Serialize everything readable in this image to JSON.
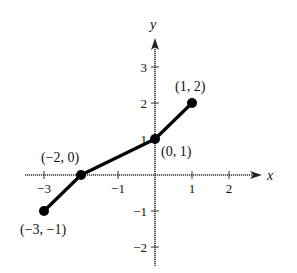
{
  "chart_data": {
    "type": "line",
    "title": "",
    "xlabel": "x",
    "ylabel": "y",
    "xlim": [
      -3.5,
      2.8
    ],
    "ylim": [
      -2.5,
      3.7
    ],
    "grid": false,
    "x_ticks": [
      -3,
      -2,
      -1,
      1,
      2
    ],
    "x_tick_labels": [
      "−3",
      "",
      "−1",
      "1",
      "2"
    ],
    "y_ticks": [
      -2,
      -1,
      1,
      2,
      3
    ],
    "y_tick_labels": [
      "−2",
      "−1",
      "1",
      "2",
      "3"
    ],
    "series": [
      {
        "name": "piecewise linear",
        "x": [
          -3,
          -2,
          0,
          1
        ],
        "y": [
          -1,
          0,
          1,
          2
        ],
        "markers": "filled-circle",
        "color": "#000000"
      }
    ],
    "annotations": [
      {
        "text": "(−3, −1)",
        "x": -3,
        "y": -1
      },
      {
        "text": "(−2, 0)",
        "x": -2,
        "y": 0
      },
      {
        "text": "(0, 1)",
        "x": 0,
        "y": 1
      },
      {
        "text": "(1, 2)",
        "x": 1,
        "y": 2
      }
    ]
  },
  "axes": {
    "x_name": "x",
    "y_name": "y"
  },
  "colors": {
    "line": "#000000",
    "axis": "#333333"
  }
}
